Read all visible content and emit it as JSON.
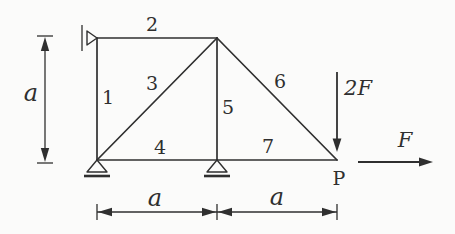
{
  "diagram": {
    "type": "truss-structure-diagram",
    "colors": {
      "ink": "#2f2f2f",
      "paper": "#fbfbfa"
    },
    "member_labels": [
      "1",
      "2",
      "3",
      "4",
      "5",
      "6",
      "7"
    ],
    "loads": {
      "vertical": "2F",
      "horizontal": "F"
    },
    "point_label": "P",
    "dimensions": {
      "height": "a",
      "span_left": "a",
      "span_right": "a"
    },
    "supports": [
      "wall-roller-at-top-left",
      "roller-at-bottom-left",
      "roller-at-bottom-middle"
    ]
  }
}
